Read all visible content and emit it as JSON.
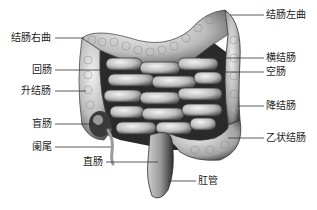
{
  "labels": {
    "right_colic_flexure": "结肠右曲",
    "ileum": "回肠",
    "ascending_colon": "升结肠",
    "cecum": "盲肠",
    "appendix": "阑尾",
    "rectum": "直肠",
    "left_colic_flexure": "结肠左曲",
    "transverse_colon": "横结肠",
    "jejunum": "空肠",
    "descending_colon": "降结肠",
    "sigmoid_colon": "乙状结肠",
    "anal_canal": "肛管"
  },
  "colors": {
    "intestine_light": "#d8d8d8",
    "intestine_mid": "#a8a8a8",
    "intestine_dark": "#3a3a3a",
    "leader_line": "#333333",
    "text": "#1a1a1a"
  }
}
